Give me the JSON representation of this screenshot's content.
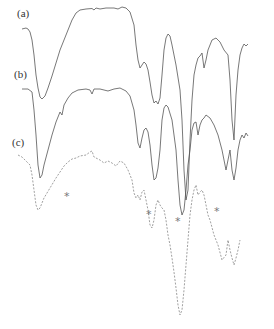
{
  "chart_data": {
    "type": "line",
    "title": "",
    "xlabel": "",
    "ylabel": "",
    "grid": false,
    "legend": "none",
    "axes_visible": false,
    "series": [
      {
        "name": "(a)",
        "label": "(a)",
        "color": "#555555",
        "style": "solid",
        "points": [
          [
            22,
            29
          ],
          [
            26,
            28
          ],
          [
            28,
            29
          ],
          [
            30,
            32
          ],
          [
            32,
            40
          ],
          [
            34,
            55
          ],
          [
            36,
            75
          ],
          [
            38,
            88
          ],
          [
            40,
            97
          ],
          [
            42,
            99
          ],
          [
            45,
            96
          ],
          [
            48,
            88
          ],
          [
            52,
            76
          ],
          [
            56,
            63
          ],
          [
            60,
            50
          ],
          [
            64,
            40
          ],
          [
            68,
            30
          ],
          [
            72,
            20
          ],
          [
            76,
            13
          ],
          [
            80,
            10
          ],
          [
            86,
            9
          ],
          [
            92,
            8.5
          ],
          [
            94,
            10
          ],
          [
            96,
            8
          ],
          [
            100,
            9
          ],
          [
            106,
            8
          ],
          [
            114,
            8
          ],
          [
            118,
            9
          ],
          [
            122,
            7
          ],
          [
            126,
            8
          ],
          [
            130,
            12
          ],
          [
            134,
            25
          ],
          [
            136,
            45
          ],
          [
            138,
            60
          ],
          [
            140,
            68
          ],
          [
            142,
            65
          ],
          [
            144,
            62
          ],
          [
            146,
            64
          ],
          [
            148,
            70
          ],
          [
            150,
            82
          ],
          [
            152,
            95
          ],
          [
            154,
            103
          ],
          [
            156,
            101
          ],
          [
            158,
            104
          ],
          [
            160,
            98
          ],
          [
            162,
            75
          ],
          [
            164,
            50
          ],
          [
            166,
            38
          ],
          [
            168,
            34
          ],
          [
            170,
            36
          ],
          [
            172,
            45
          ],
          [
            176,
            65
          ],
          [
            180,
            90
          ],
          [
            182,
            120
          ],
          [
            184,
            170
          ],
          [
            186,
            200
          ],
          [
            188,
            190
          ],
          [
            190,
            140
          ],
          [
            192,
            100
          ],
          [
            194,
            75
          ],
          [
            196,
            65
          ],
          [
            198,
            58
          ],
          [
            200,
            56
          ],
          [
            202,
            53
          ],
          [
            204,
            68
          ],
          [
            206,
            60
          ],
          [
            208,
            50
          ],
          [
            212,
            40
          ],
          [
            216,
            38
          ],
          [
            220,
            42
          ],
          [
            224,
            50
          ],
          [
            228,
            55
          ],
          [
            230,
            80
          ],
          [
            232,
            120
          ],
          [
            234,
            140
          ],
          [
            236,
            95
          ],
          [
            238,
            70
          ],
          [
            240,
            55
          ],
          [
            242,
            48
          ],
          [
            244,
            44
          ],
          [
            246,
            46
          ],
          [
            248,
            44
          ]
        ]
      },
      {
        "name": "(b)",
        "label": "(b)",
        "color": "#555555",
        "style": "solid",
        "points": [
          [
            22,
            89
          ],
          [
            28,
            89
          ],
          [
            32,
            92
          ],
          [
            34,
            110
          ],
          [
            36,
            135
          ],
          [
            38,
            165
          ],
          [
            40,
            178
          ],
          [
            42,
            175
          ],
          [
            44,
            165
          ],
          [
            48,
            150
          ],
          [
            52,
            135
          ],
          [
            56,
            122
          ],
          [
            60,
            112
          ],
          [
            62,
            115
          ],
          [
            64,
            105
          ],
          [
            68,
            98
          ],
          [
            72,
            93
          ],
          [
            78,
            90
          ],
          [
            86,
            89
          ],
          [
            90,
            90
          ],
          [
            92,
            94
          ],
          [
            94,
            89
          ],
          [
            100,
            89
          ],
          [
            108,
            91
          ],
          [
            114,
            89
          ],
          [
            120,
            88
          ],
          [
            126,
            91
          ],
          [
            130,
            96
          ],
          [
            134,
            110
          ],
          [
            136,
            125
          ],
          [
            138,
            143
          ],
          [
            140,
            148
          ],
          [
            142,
            138
          ],
          [
            144,
            130
          ],
          [
            146,
            128
          ],
          [
            148,
            132
          ],
          [
            150,
            145
          ],
          [
            152,
            165
          ],
          [
            154,
            180
          ],
          [
            156,
            178
          ],
          [
            158,
            168
          ],
          [
            160,
            150
          ],
          [
            162,
            120
          ],
          [
            164,
            108
          ],
          [
            166,
            105
          ],
          [
            168,
            107
          ],
          [
            172,
            120
          ],
          [
            176,
            150
          ],
          [
            178,
            180
          ],
          [
            180,
            205
          ],
          [
            182,
            215
          ],
          [
            184,
            210
          ],
          [
            186,
            190
          ],
          [
            188,
            165
          ],
          [
            190,
            150
          ],
          [
            192,
            130
          ],
          [
            194,
            123
          ],
          [
            196,
            122
          ],
          [
            198,
            135
          ],
          [
            200,
            125
          ],
          [
            202,
            120
          ],
          [
            204,
            118
          ],
          [
            206,
            115
          ],
          [
            210,
            118
          ],
          [
            214,
            125
          ],
          [
            218,
            135
          ],
          [
            222,
            150
          ],
          [
            226,
            170
          ],
          [
            228,
            160
          ],
          [
            230,
            150
          ],
          [
            232,
            170
          ],
          [
            234,
            180
          ],
          [
            236,
            168
          ],
          [
            238,
            150
          ],
          [
            240,
            140
          ],
          [
            242,
            135
          ],
          [
            244,
            138
          ],
          [
            246,
            133
          ],
          [
            248,
            136
          ]
        ]
      },
      {
        "name": "(c)",
        "label": "(c)",
        "color": "#888888",
        "style": "dashed",
        "points": [
          [
            18,
            155
          ],
          [
            22,
            157
          ],
          [
            26,
            161
          ],
          [
            30,
            165
          ],
          [
            32,
            175
          ],
          [
            34,
            190
          ],
          [
            36,
            205
          ],
          [
            38,
            210
          ],
          [
            40,
            208
          ],
          [
            44,
            198
          ],
          [
            50,
            188
          ],
          [
            56,
            178
          ],
          [
            60,
            172
          ],
          [
            64,
            166
          ],
          [
            68,
            162
          ],
          [
            72,
            159
          ],
          [
            76,
            158
          ],
          [
            80,
            156
          ],
          [
            86,
            155
          ],
          [
            90,
            152
          ],
          [
            92,
            151
          ],
          [
            94,
            157
          ],
          [
            96,
            158
          ],
          [
            100,
            160
          ],
          [
            104,
            163
          ],
          [
            108,
            161
          ],
          [
            112,
            163
          ],
          [
            116,
            166
          ],
          [
            120,
            161
          ],
          [
            124,
            163
          ],
          [
            128,
            170
          ],
          [
            132,
            180
          ],
          [
            134,
            193
          ],
          [
            136,
            198
          ],
          [
            138,
            195
          ],
          [
            140,
            200
          ],
          [
            142,
            192
          ],
          [
            144,
            190
          ],
          [
            146,
            200
          ],
          [
            148,
            210
          ],
          [
            150,
            225
          ],
          [
            152,
            228
          ],
          [
            154,
            220
          ],
          [
            156,
            205
          ],
          [
            158,
            200
          ],
          [
            160,
            205
          ],
          [
            162,
            208
          ],
          [
            164,
            210
          ],
          [
            166,
            220
          ],
          [
            168,
            235
          ],
          [
            170,
            245
          ],
          [
            172,
            258
          ],
          [
            174,
            272
          ],
          [
            176,
            288
          ],
          [
            178,
            305
          ],
          [
            180,
            315
          ],
          [
            182,
            310
          ],
          [
            184,
            290
          ],
          [
            186,
            265
          ],
          [
            188,
            240
          ],
          [
            190,
            215
          ],
          [
            192,
            200
          ],
          [
            194,
            190
          ],
          [
            196,
            185
          ],
          [
            198,
            195
          ],
          [
            200,
            192
          ],
          [
            202,
            190
          ],
          [
            204,
            195
          ],
          [
            206,
            205
          ],
          [
            208,
            215
          ],
          [
            210,
            220
          ],
          [
            214,
            235
          ],
          [
            218,
            245
          ],
          [
            222,
            260
          ],
          [
            226,
            255
          ],
          [
            228,
            240
          ],
          [
            230,
            250
          ],
          [
            232,
            258
          ],
          [
            234,
            265
          ],
          [
            236,
            258
          ],
          [
            238,
            250
          ],
          [
            240,
            240
          ]
        ]
      }
    ],
    "annotations": [
      {
        "text": "*",
        "x": 66,
        "y": 196
      },
      {
        "text": "*",
        "x": 148,
        "y": 214
      },
      {
        "text": "*",
        "x": 177,
        "y": 221
      },
      {
        "text": "*",
        "x": 216,
        "y": 211
      }
    ],
    "labels": [
      {
        "text": "(a)",
        "x": 17,
        "y": 8
      },
      {
        "text": "(b)",
        "x": 15,
        "y": 70
      },
      {
        "text": "(c)",
        "x": 13,
        "y": 137
      }
    ]
  }
}
